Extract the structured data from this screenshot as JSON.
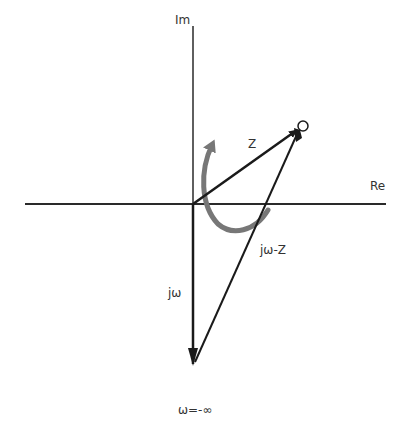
{
  "diagram": {
    "axes": {
      "imaginary_label": "Im",
      "real_label": "Re"
    },
    "vectors": {
      "z_label": "Z",
      "jw_minus_z_label": "jω-Z",
      "jw_label": "jω"
    },
    "endpoint_label": "ω=-∞",
    "colors": {
      "line": "#1a1a1a",
      "rotation_arrow": "#777777"
    }
  }
}
